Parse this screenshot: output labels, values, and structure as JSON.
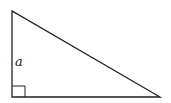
{
  "diagram": {
    "type": "right-triangle",
    "label_vertical_side": "a",
    "right_angle_marker": true,
    "vertices": {
      "top_left": [
        12,
        11
      ],
      "bottom_left": [
        12,
        97
      ],
      "bottom_right": [
        160,
        97
      ]
    },
    "stroke_color": "#222222"
  }
}
